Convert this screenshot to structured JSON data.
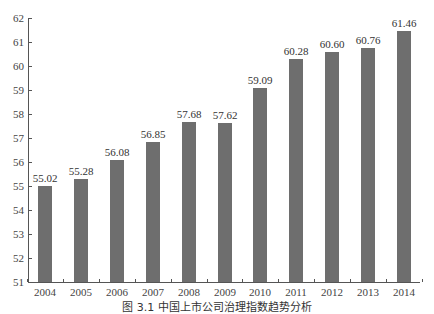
{
  "chart_data": {
    "type": "bar",
    "title": "",
    "xlabel": "",
    "ylabel": "",
    "categories": [
      "2004",
      "2005",
      "2006",
      "2007",
      "2008",
      "2009",
      "2010",
      "2011",
      "2012",
      "2013",
      "2014"
    ],
    "values": [
      55.02,
      55.28,
      56.08,
      56.85,
      57.68,
      57.62,
      59.09,
      60.28,
      60.6,
      60.76,
      61.46
    ],
    "value_labels": [
      "55.02",
      "55.28",
      "56.08",
      "56.85",
      "57.68",
      "57.62",
      "59.09",
      "60.28",
      "60.60",
      "60.76",
      "61.46"
    ],
    "ylim": [
      51,
      62
    ],
    "yticks": [
      51,
      52,
      53,
      54,
      55,
      56,
      57,
      58,
      59,
      60,
      61,
      62
    ],
    "grid": false,
    "legend": null,
    "bar_color": "#6e6e6e"
  },
  "caption": "图 3.1   中国上市公司治理指数趋势分析"
}
